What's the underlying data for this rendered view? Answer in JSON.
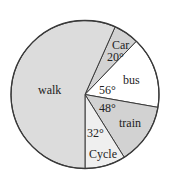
{
  "chart_data": {
    "type": "pie",
    "title": "",
    "unit": "degrees",
    "categories": [
      "walk",
      "Car",
      "bus",
      "train",
      "Cycle"
    ],
    "values": [
      204,
      20,
      56,
      48,
      32
    ],
    "labels": {
      "walk": "walk",
      "car": "Car",
      "bus": "bus",
      "train": "train",
      "cycle": "Cycle"
    },
    "angle_labels": {
      "walk": "",
      "car": "20°",
      "bus": "56°",
      "train": "48°",
      "cycle": "32°"
    },
    "colors": {
      "walk": "#dcdcdc",
      "car": "#d2d2d2",
      "bus": "#ffffff",
      "train": "#d2d2d2",
      "cycle": "#efefef"
    },
    "legend": "none",
    "grid": false
  }
}
